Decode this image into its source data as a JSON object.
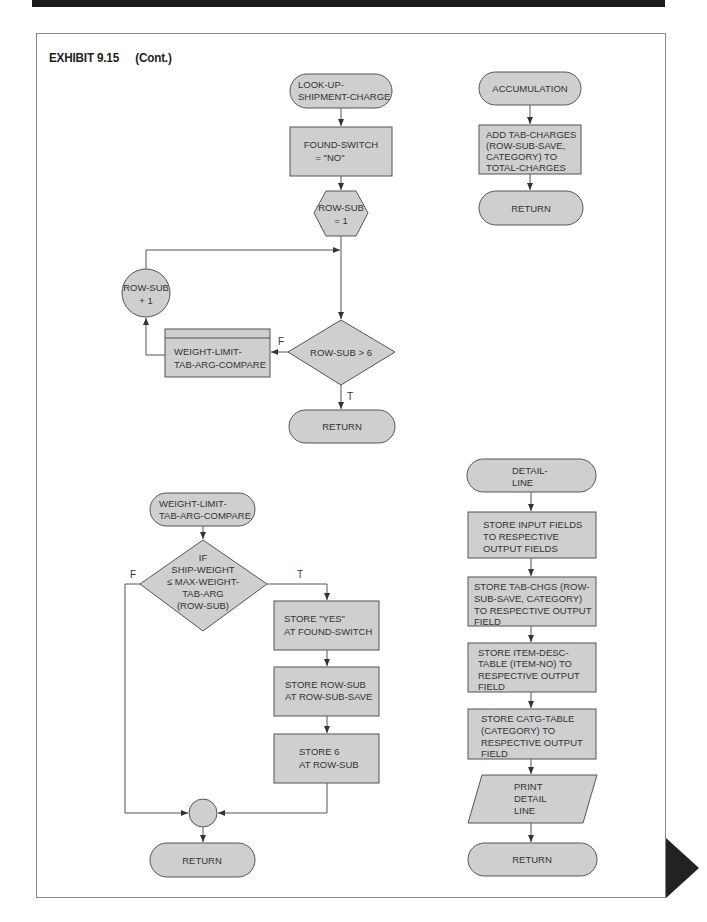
{
  "header": {
    "exhibit_label": "EXHIBIT 9.15",
    "continued_label": "(Cont.)"
  },
  "lookup": {
    "start": [
      "LOOK-UP-",
      "SHIPMENT-CHARGE"
    ],
    "init_box": [
      "FOUND-SWITCH",
      "= \"NO\""
    ],
    "prep_hex": [
      "ROW-SUB",
      "= 1"
    ],
    "increment_circle": [
      "ROW-SUB",
      "+ 1"
    ],
    "compare_subroutine": [
      "WEIGHT-LIMIT-",
      "TAB-ARG-COMPARE"
    ],
    "decision": "ROW-SUB > 6",
    "false_label": "F",
    "true_label": "T",
    "end": "RETURN"
  },
  "accumulation": {
    "start": "ACCUMULATION",
    "add_box": [
      "ADD TAB-CHARGES",
      "(ROW-SUB-SAVE,",
      "CATEGORY) TO",
      "TOTAL-CHARGES"
    ],
    "end": "RETURN"
  },
  "compare": {
    "start": [
      "WEIGHT-LIMIT-",
      "TAB-ARG-COMPARE"
    ],
    "decision": [
      "IF",
      "SHIP-WEIGHT",
      "≤ MAX-WEIGHT-",
      "TAB-ARG",
      "(ROW-SUB)"
    ],
    "false_label": "F",
    "true_label": "T",
    "store_yes": [
      "STORE \"YES\"",
      "AT FOUND-SWITCH"
    ],
    "store_row_sub": [
      "STORE ROW-SUB",
      "AT ROW-SUB-SAVE"
    ],
    "store_six": [
      "STORE 6",
      "AT ROW-SUB"
    ],
    "end": "RETURN"
  },
  "detail_line": {
    "start": [
      "DETAIL-",
      "LINE"
    ],
    "step1": [
      "STORE INPUT FIELDS",
      "TO RESPECTIVE",
      "OUTPUT FIELDS"
    ],
    "step2": [
      "STORE TAB-CHGS (ROW-",
      "SUB-SAVE, CATEGORY)",
      "TO RESPECTIVE OUTPUT",
      "FIELD"
    ],
    "step3": [
      "STORE ITEM-DESC-",
      "TABLE (ITEM-NO) TO",
      "RESPECTIVE OUTPUT",
      "FIELD"
    ],
    "step4": [
      "STORE CATG-TABLE",
      "(CATEGORY) TO",
      "RESPECTIVE OUTPUT",
      "FIELD"
    ],
    "print": [
      "PRINT",
      "DETAIL",
      "LINE"
    ],
    "end": "RETURN"
  },
  "colors": {
    "shape_fill": "#cfcfcf",
    "stroke": "#555555",
    "top_bar": "#1c1c1c",
    "page_turn": "#222222"
  }
}
